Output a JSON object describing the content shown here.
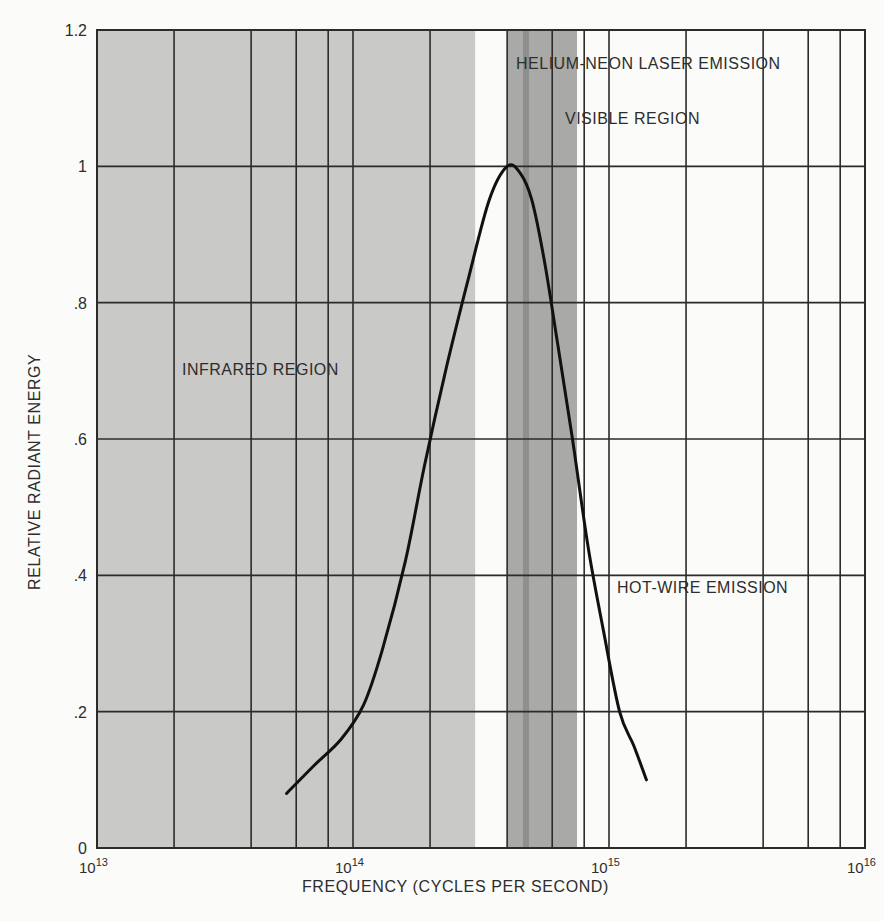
{
  "chart_data": {
    "type": "line",
    "title": "",
    "xlabel": "FREQUENCY (CYCLES PER SECOND)",
    "ylabel": "RELATIVE RADIANT ENERGY",
    "xscale": "log",
    "xlim": [
      10000000000000.0,
      1e+16
    ],
    "ylim": [
      0,
      1.2
    ],
    "grid": true,
    "x_tick_labels": [
      {
        "base": "10",
        "exp": "13",
        "value": 10000000000000.0
      },
      {
        "base": "10",
        "exp": "14",
        "value": 100000000000000.0
      },
      {
        "base": "10",
        "exp": "15",
        "value": 1000000000000000.0
      },
      {
        "base": "10",
        "exp": "16",
        "value": 1e+16
      }
    ],
    "y_tick_labels": [
      "0",
      ".2",
      ".4",
      ".6",
      ".8",
      "1",
      "1.2"
    ],
    "y_ticks": [
      0,
      0.2,
      0.4,
      0.6,
      0.8,
      1.0,
      1.2
    ],
    "x_gridlines": [
      10000000000000.0,
      20000000000000.0,
      40000000000000.0,
      60000000000000.0,
      80000000000000.0,
      100000000000000.0,
      200000000000000.0,
      400000000000000.0,
      600000000000000.0,
      800000000000000.0,
      1000000000000000.0,
      2000000000000000.0,
      4000000000000000.0,
      6000000000000000.0,
      8000000000000000.0,
      1e+16
    ],
    "series": [
      {
        "name": "Hot-wire emission",
        "x": [
          55000000000000.0,
          70000000000000.0,
          90000000000000.0,
          110000000000000.0,
          130000000000000.0,
          160000000000000.0,
          190000000000000.0,
          230000000000000.0,
          280000000000000.0,
          340000000000000.0,
          400000000000000.0,
          450000000000000.0,
          500000000000000.0,
          560000000000000.0,
          630000000000000.0,
          720000000000000.0,
          830000000000000.0,
          950000000000000.0,
          1100000000000000.0,
          1250000000000000.0,
          1400000000000000.0
        ],
        "y": [
          0.08,
          0.12,
          0.16,
          0.21,
          0.29,
          0.42,
          0.56,
          0.7,
          0.83,
          0.95,
          1.0,
          0.99,
          0.95,
          0.86,
          0.74,
          0.6,
          0.44,
          0.32,
          0.2,
          0.15,
          0.1
        ]
      }
    ],
    "regions": [
      {
        "name": "Infrared region",
        "x_start": 10000000000000.0,
        "x_end": 300000000000000.0,
        "shade": "#c9c9c7"
      },
      {
        "name": "Visible region",
        "x_start": 400000000000000.0,
        "x_end": 750000000000000.0,
        "shade": "#a9a9a7"
      },
      {
        "name": "Helium-neon laser emission",
        "x_center": 474000000000000.0,
        "shade": "#8f8f8d"
      }
    ],
    "annotations": [
      "HELIUM-NEON LASER EMISSION",
      "VISIBLE REGION",
      "INFRARED REGION",
      "HOT-WIRE EMISSION"
    ]
  },
  "labels": {
    "xlabel": "FREQUENCY (CYCLES PER SECOND)",
    "ylabel": "RELATIVE RADIANT ENERGY",
    "helium_neon": "HELIUM-NEON LASER EMISSION",
    "visible": "VISIBLE REGION",
    "infrared": "INFRARED REGION",
    "hotwire": "HOT-WIRE EMISSION"
  },
  "colors": {
    "infrared_shade": "#c9c9c7",
    "visible_shade": "#a9a9a7",
    "laser_line": "#8f8f8d",
    "grid": "#2b2b2b",
    "curve": "#111111",
    "background": "#fbfbfa"
  }
}
